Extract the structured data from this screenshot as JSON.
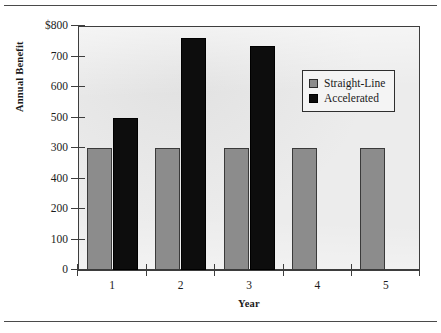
{
  "chart_data": {
    "type": "bar",
    "title": "",
    "xlabel": "Year",
    "ylabel": "Annual Benefit",
    "categories": [
      "1",
      "2",
      "3",
      "4",
      "5"
    ],
    "series": [
      {
        "name": "Straight-Line",
        "color": "#8c8c8c",
        "values": [
          400,
          400,
          400,
          400,
          400
        ]
      },
      {
        "name": "Accelerated",
        "color": "#0d0d0d",
        "values": [
          500,
          760,
          735,
          null,
          null
        ]
      }
    ],
    "ylim": [
      0,
      800
    ],
    "ytick_values": [
      800,
      700,
      600,
      500,
      300,
      400,
      200,
      100,
      0
    ],
    "ytick_labels": [
      "$800",
      "700",
      "600",
      "500",
      "300",
      "400",
      "200",
      "100",
      "0"
    ],
    "grid": false,
    "legend_position": "upper right",
    "plot_background": "#ececec",
    "axis_color": "#3d3d3d"
  },
  "legend": {
    "items": [
      {
        "label": "Straight-Line",
        "swatch": "straight"
      },
      {
        "label": "Accelerated",
        "swatch": "accel"
      }
    ]
  }
}
